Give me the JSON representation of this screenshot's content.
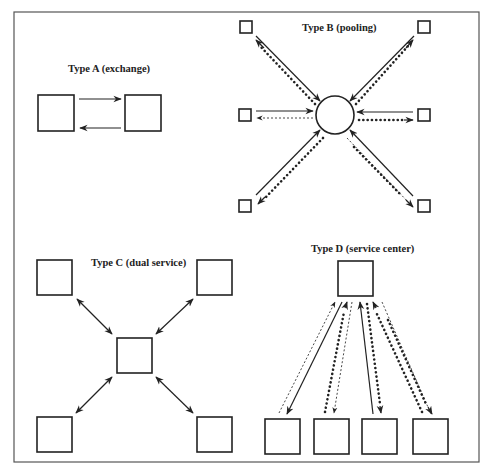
{
  "figure": {
    "panels": [
      {
        "id": "A",
        "label": "Type A (exchange)"
      },
      {
        "id": "B",
        "label": "Type B (pooling)"
      },
      {
        "id": "C",
        "label": "Type C (dual service)"
      },
      {
        "id": "D",
        "label": "Type D (service center)"
      }
    ]
  },
  "colors": {
    "line": "#222222",
    "background": "#ffffff",
    "frame": "#555555"
  }
}
